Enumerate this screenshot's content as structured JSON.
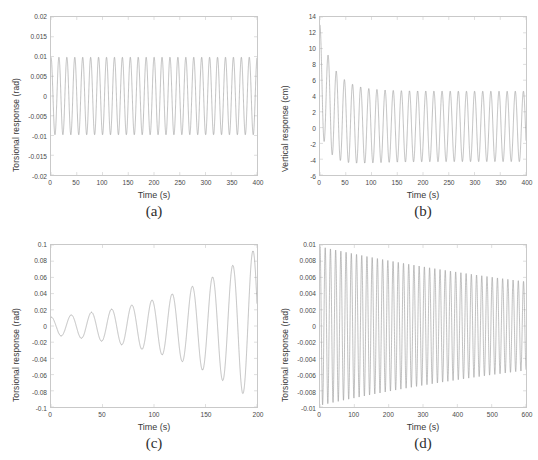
{
  "figure": {
    "background": "#ffffff",
    "line_color": "#8c8c8c",
    "axis_color": "#c9c9c9",
    "text_color": "#3a3a3a"
  },
  "panels": [
    {
      "key": "a",
      "caption": "(a)",
      "xlabel": "Time (s)",
      "ylabel": "Torsional response (rad)",
      "yticks": [
        "0.02",
        "0.015",
        "0.01",
        "0.005",
        "0",
        "-0.005",
        "-0.01",
        "-0.015",
        "-0.02"
      ],
      "xticks": [
        "0",
        "50",
        "100",
        "150",
        "200",
        "250",
        "300",
        "350",
        "400"
      ]
    },
    {
      "key": "b",
      "caption": "(b)",
      "xlabel": "Time (s)",
      "ylabel": "Vertical response (cm)",
      "yticks": [
        "14",
        "12",
        "10",
        "8",
        "6",
        "4",
        "2",
        "0",
        "-2",
        "-4",
        "-6"
      ],
      "xticks": [
        "0",
        "50",
        "100",
        "150",
        "200",
        "250",
        "300",
        "350",
        "400"
      ]
    },
    {
      "key": "c",
      "caption": "(c)",
      "xlabel": "Time (s)",
      "ylabel": "Torsional response (rad)",
      "yticks": [
        "0.1",
        "0.08",
        "0.06",
        "0.04",
        "0.02",
        "0",
        "-0.02",
        "-0.04",
        "-0.06",
        "-0.08",
        "-0.1"
      ],
      "xticks": [
        "0",
        "50",
        "100",
        "150",
        "200"
      ]
    },
    {
      "key": "d",
      "caption": "(d)",
      "xlabel": "Time (s)",
      "ylabel": "Torsional response (rad)",
      "yticks": [
        "0.01",
        "0.008",
        "0.006",
        "0.004",
        "0.002",
        "0",
        "-0.002",
        "-0.004",
        "-0.006",
        "-0.008",
        "-0.01"
      ],
      "xticks": [
        "0",
        "100",
        "200",
        "300",
        "400",
        "500",
        "600"
      ]
    }
  ],
  "chart_data": [
    {
      "type": "line",
      "panel": "a",
      "title": "(a)",
      "xlabel": "Time (s)",
      "ylabel": "Torsional response (rad)",
      "xlim": [
        0,
        400
      ],
      "ylim": [
        -0.02,
        0.02
      ],
      "xticks": [
        0,
        50,
        100,
        150,
        200,
        250,
        300,
        350,
        400
      ],
      "yticks": [
        -0.02,
        -0.015,
        -0.01,
        -0.005,
        0,
        0.005,
        0.01,
        0.015,
        0.02
      ],
      "grid": false,
      "legend": "none",
      "description": "Steady-state sinusoidal torsional response of constant amplitude",
      "waveform": {
        "model": "amplitude * sin(2*pi*t/period + phase) + offset",
        "amplitude_start": 0.0098,
        "amplitude_end": 0.0098,
        "period": 15.4,
        "phase": 1.5708,
        "offset": 0.0,
        "cycles": 26
      },
      "series": [
        {
          "name": "Torsional response",
          "x": [
            0,
            20,
            40,
            60,
            80,
            100,
            120,
            140,
            160,
            180,
            200,
            220,
            240,
            260,
            280,
            300,
            320,
            340,
            360,
            380,
            400
          ],
          "peak_envelope": [
            0.0098,
            0.0098,
            0.0098,
            0.0098,
            0.0098,
            0.0098,
            0.0098,
            0.0098,
            0.0098,
            0.0098,
            0.0098,
            0.0098,
            0.0098,
            0.0098,
            0.0098,
            0.0098,
            0.0098,
            0.0098,
            0.0098,
            0.0098,
            0.0098
          ],
          "trough_envelope": [
            -0.0098,
            -0.0098,
            -0.0098,
            -0.0098,
            -0.0098,
            -0.0098,
            -0.0098,
            -0.0098,
            -0.0098,
            -0.0098,
            -0.0098,
            -0.0098,
            -0.0098,
            -0.0098,
            -0.0098,
            -0.0098,
            -0.0098,
            -0.0098,
            -0.0098,
            -0.0098,
            -0.0098
          ]
        }
      ]
    },
    {
      "type": "line",
      "panel": "b",
      "title": "(b)",
      "xlabel": "Time (s)",
      "ylabel": "Vertical response (cm)",
      "xlim": [
        0,
        400
      ],
      "ylim": [
        -6,
        14
      ],
      "xticks": [
        0,
        50,
        100,
        150,
        200,
        250,
        300,
        350,
        400
      ],
      "yticks": [
        -6,
        -4,
        -2,
        0,
        2,
        4,
        6,
        8,
        10,
        12,
        14
      ],
      "grid": false,
      "legend": "none",
      "description": "Vertical response with a large initial transient decaying to a steady oscillation near plus/minus 4.5 cm",
      "waveform": {
        "model": "(a_inf + (a_0 - a_inf)*exp(-t/tau)) * sin(2*pi*t/period + phase) + offset",
        "amplitude_start": 6.6,
        "amplitude_end": 4.45,
        "decay_tau": 45,
        "period": 15.8,
        "phase": 1.5708,
        "offset": 0.15,
        "initial_peak": 13.0,
        "cycles": 25
      },
      "series": [
        {
          "name": "Vertical response",
          "x": [
            5,
            25,
            45,
            65,
            85,
            105,
            125,
            145,
            165,
            185,
            205,
            245,
            285,
            325,
            365,
            400
          ],
          "peak_envelope": [
            13.0,
            9.1,
            7.0,
            6.0,
            5.2,
            4.9,
            4.7,
            4.65,
            4.6,
            4.55,
            4.55,
            4.5,
            4.5,
            4.5,
            4.5,
            4.5
          ],
          "trough_envelope": [
            1.9,
            -1.1,
            -2.4,
            -3.4,
            -3.9,
            -4.1,
            -4.2,
            -4.25,
            -4.3,
            -4.3,
            -4.3,
            -4.3,
            -4.3,
            -4.3,
            -4.3,
            -4.3
          ]
        }
      ]
    },
    {
      "type": "line",
      "panel": "c",
      "title": "(c)",
      "xlabel": "Time (s)",
      "ylabel": "Torsional response (rad)",
      "xlim": [
        0,
        200
      ],
      "ylim": [
        -0.1,
        0.1
      ],
      "xticks": [
        0,
        50,
        100,
        150,
        200
      ],
      "yticks": [
        -0.1,
        -0.08,
        -0.06,
        -0.04,
        -0.02,
        0,
        0.02,
        0.04,
        0.06,
        0.08,
        0.1
      ],
      "grid": false,
      "legend": "none",
      "description": "Divergent (flutter) torsional response with exponentially growing amplitude",
      "waveform": {
        "model": "amplitude_0 * exp(t/tau) * sin(2*pi*t/period + phase)",
        "amplitude_start": 0.011,
        "amplitude_end": 0.095,
        "growth_tau": 92,
        "period": 19.6,
        "phase": 1.5708,
        "offset": 0.0,
        "cycles": 10
      },
      "series": [
        {
          "name": "Torsional response",
          "x": [
            0,
            20,
            39,
            59,
            78,
            98,
            117,
            137,
            156,
            176,
            196
          ],
          "peak_envelope": [
            0.011,
            0.014,
            0.016,
            0.021,
            0.026,
            0.031,
            0.038,
            0.047,
            0.06,
            0.075,
            0.095
          ],
          "trough_envelope": [
            -0.011,
            -0.014,
            -0.017,
            -0.021,
            -0.026,
            -0.033,
            -0.041,
            -0.053,
            -0.066,
            -0.084,
            -0.095
          ]
        }
      ]
    },
    {
      "type": "line",
      "panel": "d",
      "title": "(d)",
      "xlabel": "Time (s)",
      "ylabel": "Torsional response (rad)",
      "xlim": [
        0,
        600
      ],
      "ylim": [
        -0.01,
        0.01
      ],
      "xticks": [
        0,
        100,
        200,
        300,
        400,
        500,
        600
      ],
      "yticks": [
        -0.01,
        -0.008,
        -0.006,
        -0.004,
        -0.002,
        0,
        0.002,
        0.004,
        0.006,
        0.008,
        0.01
      ],
      "grid": false,
      "legend": "none",
      "description": "Slowly damped torsional response with gradually decreasing amplitude",
      "waveform": {
        "model": "amplitude_0 * exp(-t/tau) * sin(2*pi*t/period + phase)",
        "amplitude_start": 0.0098,
        "amplitude_end": 0.0055,
        "decay_tau": 1030,
        "period": 15.2,
        "phase": 1.5708,
        "offset": 0.0,
        "cycles": 39
      },
      "series": [
        {
          "name": "Torsional response",
          "x": [
            15,
            75,
            150,
            225,
            300,
            375,
            450,
            525,
            600
          ],
          "peak_envelope": [
            0.0098,
            0.0092,
            0.0086,
            0.008,
            0.0074,
            0.0068,
            0.0063,
            0.0058,
            0.0055
          ],
          "trough_envelope": [
            -0.0098,
            -0.0092,
            -0.0086,
            -0.008,
            -0.0074,
            -0.0068,
            -0.0063,
            -0.0058,
            -0.0055
          ]
        }
      ]
    }
  ]
}
